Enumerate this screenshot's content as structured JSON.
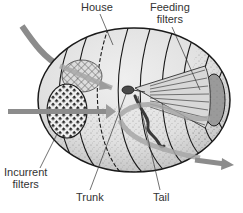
{
  "figure": {
    "labels": {
      "house": "House",
      "feeding_filters_line1": "Feeding",
      "feeding_filters_line2": "filters",
      "incurrent_filters_line1": "Incurrent",
      "incurrent_filters_line2": "filters",
      "trunk": "Trunk",
      "tail": "Tail"
    },
    "colors": {
      "house_fill": "#e4e4e4",
      "house_outline": "#1a1a1a",
      "flow_arrow": "#8c8c8c",
      "mesh": "#2a2a2a",
      "text": "#333333"
    },
    "flow_arrows": [
      {
        "name": "upper-incurrent-flow",
        "direction": "in"
      },
      {
        "name": "lower-incurrent-flow",
        "direction": "in"
      },
      {
        "name": "excurrent-flow",
        "direction": "out"
      }
    ]
  }
}
